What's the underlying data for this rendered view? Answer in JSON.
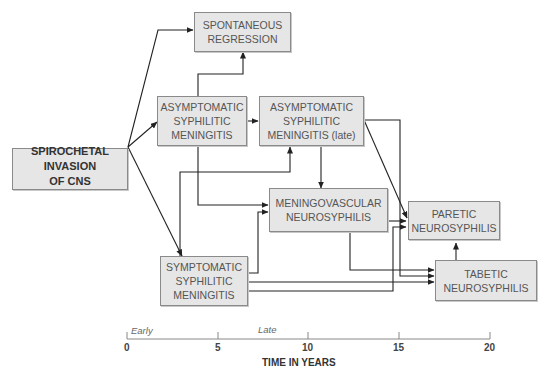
{
  "nodes": {
    "spirochetal": {
      "label": "SPIROCHETAL\nINVASION\nOF CNS"
    },
    "spontaneous": {
      "label": "SPONTANEOUS\nREGRESSION"
    },
    "asymptomatic_early": {
      "label": "ASYMPTOMATIC\nSYPHILITIC\nMENINGITIS"
    },
    "asymptomatic_late": {
      "label": "ASYMPTOMATIC\nSYPHILITIC\nMENINGITIS (late)"
    },
    "meningovascular": {
      "label": "MENINGOVASCULAR\nNEUROSYPHILIS"
    },
    "paretic": {
      "label": "PARETIC\nNEUROSYPHILIS"
    },
    "symptomatic": {
      "label": "SYMPTOMATIC\nSYPHILITIC\nMENINGITIS"
    },
    "tabetic": {
      "label": "TABETIC\nNEUROSYPHILIS"
    }
  },
  "edges": [
    {
      "from": "SPIROCHETAL INVASION OF CNS",
      "to": "SPONTANEOUS REGRESSION"
    },
    {
      "from": "SPIROCHETAL INVASION OF CNS",
      "to": "ASYMPTOMATIC SYPHILITIC MENINGITIS"
    },
    {
      "from": "SPIROCHETAL INVASION OF CNS",
      "to": "SYMPTOMATIC SYPHILITIC MENINGITIS"
    },
    {
      "from": "ASYMPTOMATIC SYPHILITIC MENINGITIS",
      "to": "SPONTANEOUS REGRESSION"
    },
    {
      "from": "ASYMPTOMATIC SYPHILITIC MENINGITIS",
      "to": "ASYMPTOMATIC SYPHILITIC MENINGITIS (late)"
    },
    {
      "from": "ASYMPTOMATIC SYPHILITIC MENINGITIS",
      "to": "MENINGOVASCULAR NEUROSYPHILIS"
    },
    {
      "from": "ASYMPTOMATIC SYPHILITIC MENINGITIS (late)",
      "to": "MENINGOVASCULAR NEUROSYPHILIS"
    },
    {
      "from": "ASYMPTOMATIC SYPHILITIC MENINGITIS (late)",
      "to": "PARETIC NEUROSYPHILIS"
    },
    {
      "from": "ASYMPTOMATIC SYPHILITIC MENINGITIS (late)",
      "to": "TABETIC NEUROSYPHILIS"
    },
    {
      "from": "SYMPTOMATIC SYPHILITIC MENINGITIS",
      "to": "ASYMPTOMATIC SYPHILITIC MENINGITIS (late)"
    },
    {
      "from": "SYMPTOMATIC SYPHILITIC MENINGITIS",
      "to": "MENINGOVASCULAR NEUROSYPHILIS"
    },
    {
      "from": "SYMPTOMATIC SYPHILITIC MENINGITIS",
      "to": "PARETIC NEUROSYPHILIS"
    },
    {
      "from": "SYMPTOMATIC SYPHILITIC MENINGITIS",
      "to": "TABETIC NEUROSYPHILIS"
    },
    {
      "from": "MENINGOVASCULAR NEUROSYPHILIS",
      "to": "PARETIC NEUROSYPHILIS"
    },
    {
      "from": "MENINGOVASCULAR NEUROSYPHILIS",
      "to": "TABETIC NEUROSYPHILIS"
    },
    {
      "from": "TABETIC NEUROSYPHILIS",
      "to": "PARETIC NEUROSYPHILIS"
    }
  ],
  "timeline": {
    "ticks": [
      "0",
      "5",
      "10",
      "15",
      "20"
    ],
    "phase_early": "Early",
    "phase_late": "Late",
    "title": "TIME IN YEARS"
  }
}
